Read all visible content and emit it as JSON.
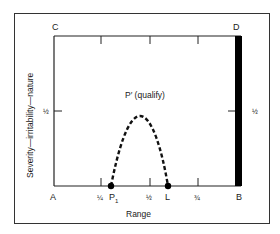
{
  "diagram": {
    "corners": {
      "top_left": "C",
      "top_right": "D",
      "bottom_left": "A",
      "bottom_right": "B"
    },
    "x_axis": {
      "label": "Range",
      "ticks": [
        "¼",
        "½",
        "¾"
      ],
      "points": [
        {
          "label": "P",
          "subscript": "1"
        },
        {
          "label": "L",
          "subscript": ""
        }
      ]
    },
    "y_axis": {
      "label": "Severity—irritability—nature",
      "tick_left": "½",
      "tick_right": "½"
    },
    "curve_label": "P′ (qualify)",
    "colors": {
      "line": "#1a1a1a",
      "background": "#ffffff",
      "bar": "#000000"
    }
  }
}
